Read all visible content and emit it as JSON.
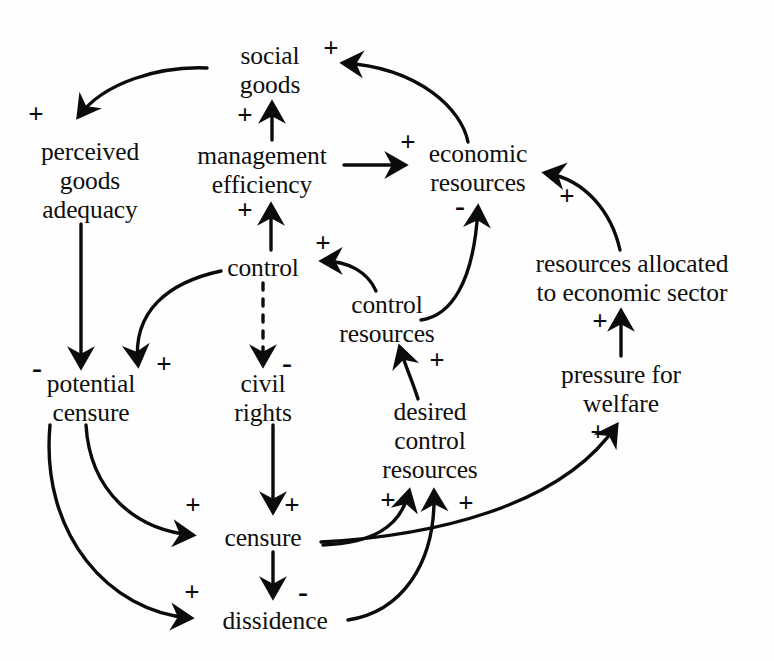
{
  "diagram": {
    "type": "causal-loop-diagram",
    "width": 774,
    "height": 661,
    "background_color": "#fefefe",
    "ink_color": "#0b0b0b",
    "nodes": [
      {
        "id": "social-goods",
        "label_lines": [
          "social",
          "goods"
        ],
        "x": 270,
        "y": 70
      },
      {
        "id": "perceived-goods-adequacy",
        "label_lines": [
          "perceived",
          "goods",
          "adequacy"
        ],
        "x": 90,
        "y": 180
      },
      {
        "id": "management-efficiency",
        "label_lines": [
          "management",
          "efficiency"
        ],
        "x": 262,
        "y": 170
      },
      {
        "id": "economic-resources",
        "label_lines": [
          "economic",
          "resources"
        ],
        "x": 478,
        "y": 168
      },
      {
        "id": "control",
        "label_lines": [
          "control"
        ],
        "x": 263,
        "y": 267
      },
      {
        "id": "control-resources",
        "label_lines": [
          "control",
          "resources"
        ],
        "x": 387,
        "y": 319
      },
      {
        "id": "resources-allocated-to-economic-sector",
        "label_lines": [
          "resources allocated",
          "to economic sector"
        ],
        "x": 632,
        "y": 278
      },
      {
        "id": "potential-censure",
        "label_lines": [
          "potential",
          "censure"
        ],
        "x": 91,
        "y": 398
      },
      {
        "id": "civil-rights",
        "label_lines": [
          "civil",
          "rights"
        ],
        "x": 263,
        "y": 398
      },
      {
        "id": "desired-control-resources",
        "label_lines": [
          "desired",
          "control",
          "resources"
        ],
        "x": 430,
        "y": 440
      },
      {
        "id": "pressure-for-welfare",
        "label_lines": [
          "pressure for",
          "welfare"
        ],
        "x": 621,
        "y": 389
      },
      {
        "id": "censure",
        "label_lines": [
          "censure"
        ],
        "x": 263,
        "y": 537
      },
      {
        "id": "dissidence",
        "label_lines": [
          "dissidence"
        ],
        "x": 275,
        "y": 620
      }
    ],
    "links": [
      {
        "from": "social-goods",
        "to": "perceived-goods-adequacy",
        "polarity": "+",
        "style": "solid",
        "sign_x": 36,
        "sign_y": 114
      },
      {
        "from": "economic-resources",
        "to": "social-goods",
        "polarity": "+",
        "style": "solid",
        "sign_x": 331,
        "sign_y": 48
      },
      {
        "from": "management-efficiency",
        "to": "social-goods",
        "polarity": "+",
        "style": "solid",
        "sign_x": 245,
        "sign_y": 115
      },
      {
        "from": "management-efficiency",
        "to": "economic-resources",
        "polarity": "+",
        "style": "solid",
        "sign_x": 408,
        "sign_y": 142
      },
      {
        "from": "control",
        "to": "management-efficiency",
        "polarity": "+",
        "style": "solid",
        "sign_x": 245,
        "sign_y": 210
      },
      {
        "from": "control-resources",
        "to": "control",
        "polarity": "+",
        "style": "solid",
        "sign_x": 323,
        "sign_y": 243
      },
      {
        "from": "control-resources",
        "to": "economic-resources",
        "polarity": "-",
        "style": "solid",
        "sign_x": 460,
        "sign_y": 206
      },
      {
        "from": "resources-allocated-to-economic-sector",
        "to": "economic-resources",
        "polarity": "+",
        "style": "solid",
        "sign_x": 567,
        "sign_y": 196
      },
      {
        "from": "pressure-for-welfare",
        "to": "resources-allocated-to-economic-sector",
        "polarity": "+",
        "style": "solid",
        "sign_x": 600,
        "sign_y": 321
      },
      {
        "from": "censure",
        "to": "pressure-for-welfare",
        "polarity": "+",
        "style": "solid",
        "sign_x": 598,
        "sign_y": 432
      },
      {
        "from": "perceived-goods-adequacy",
        "to": "potential-censure",
        "polarity": "-",
        "style": "solid",
        "sign_x": 37,
        "sign_y": 368
      },
      {
        "from": "control",
        "to": "potential-censure",
        "polarity": "+",
        "style": "solid",
        "sign_x": 164,
        "sign_y": 364
      },
      {
        "from": "control",
        "to": "civil-rights",
        "polarity": "-",
        "style": "dashed",
        "sign_x": 287,
        "sign_y": 363
      },
      {
        "from": "potential-censure",
        "to": "censure",
        "polarity": "+",
        "style": "solid",
        "sign_x": 193,
        "sign_y": 505
      },
      {
        "from": "civil-rights",
        "to": "censure",
        "polarity": "+",
        "style": "solid",
        "sign_x": 292,
        "sign_y": 505
      },
      {
        "from": "potential-censure",
        "to": "dissidence",
        "polarity": "+",
        "style": "solid",
        "sign_x": 192,
        "sign_y": 592
      },
      {
        "from": "censure",
        "to": "dissidence",
        "polarity": "-",
        "style": "solid",
        "sign_x": 303,
        "sign_y": 592
      },
      {
        "from": "censure",
        "to": "desired-control-resources",
        "polarity": "+",
        "style": "solid",
        "sign_x": 388,
        "sign_y": 500
      },
      {
        "from": "dissidence",
        "to": "desired-control-resources",
        "polarity": "+",
        "style": "solid",
        "sign_x": 466,
        "sign_y": 503
      },
      {
        "from": "desired-control-resources",
        "to": "control-resources",
        "polarity": "+",
        "style": "solid",
        "sign_x": 437,
        "sign_y": 360
      }
    ]
  }
}
